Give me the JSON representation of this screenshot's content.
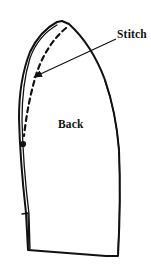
{
  "figure": {
    "background_color": "#ffffff",
    "ink_color": "#111111",
    "width": 151,
    "height": 278,
    "labels": {
      "stitch": "Stitch",
      "back": "Back"
    },
    "annotations": {
      "stitch_leader_description": "arrow from Stitch label to dashed stitch line",
      "stitch_dot_description": "filled dot at lower end of dashed stitch line"
    },
    "shape": {
      "name": "pattern-piece-back",
      "description": "pointed gothic-arch shaped garment pattern piece with seam allowance double outline",
      "outline_path": "M 62 21 L 69 24 Q 92 45 105 80 Q 116 112 119 150 Q 121 200 118 256 L 106 256 L 28 250 L 26 213 Q 20 160 19 118 Q 19 80 30 52 Q 40 31 57 22 Z",
      "inner_seam_path": "M 57 25 Q 38 36 30 58 Q 22 84 22 120 Q 23 165 29 214 L 30 249",
      "outer_seam_path": "M 118 252 Q 121 200 119 150 Q 116 112 105 81",
      "stitch_dash_path": "M 66 28 Q 47 44 37 72 Q 28 100 24 136",
      "stitch_dot": {
        "cx": 23,
        "cy": 144,
        "r": 3.1
      },
      "bottom_notch_path": "M 22 214 L 28 213 L 29 249",
      "arrow": {
        "from_x": 116,
        "from_y": 39,
        "to_x": 32,
        "to_y": 78
      }
    },
    "style": {
      "stroke_width_outline": 2.0,
      "stroke_width_inner": 1.3,
      "stroke_width_dash": 2.2,
      "dash_pattern": "5,4",
      "stroke_width_arrow": 1.2
    }
  }
}
